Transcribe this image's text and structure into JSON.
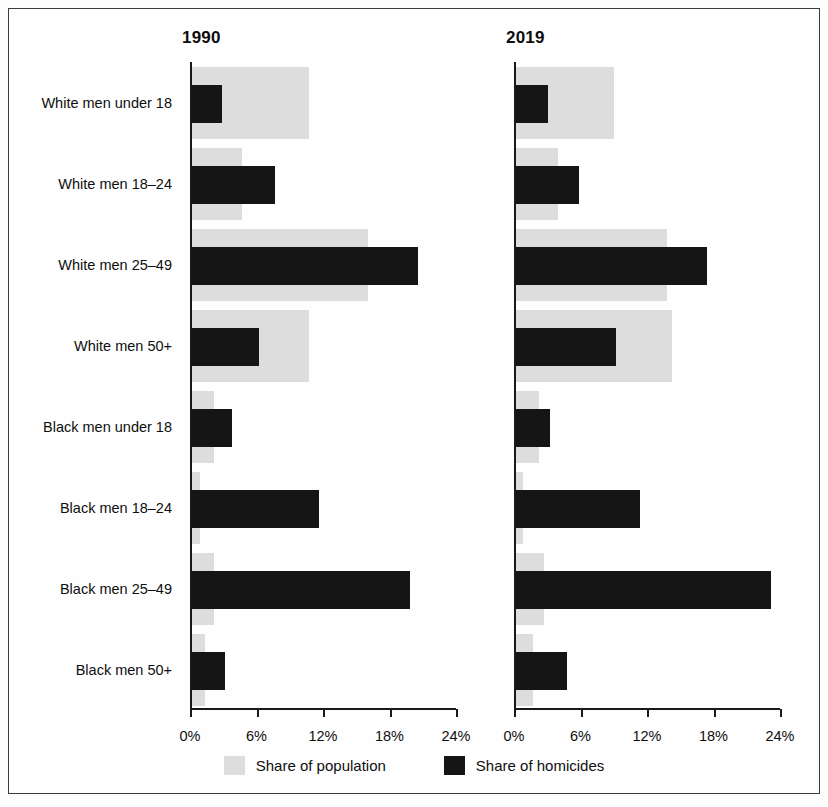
{
  "figure": {
    "panels": [
      {
        "key": "p1990",
        "title": "1990"
      },
      {
        "key": "p2019",
        "title": "2019"
      }
    ],
    "legend": [
      {
        "name": "population",
        "label": "Share of population",
        "color": "#dddddd"
      },
      {
        "name": "homicides",
        "label": "Share of homicides",
        "color": "#151515"
      }
    ]
  },
  "chart_data": {
    "type": "bar",
    "title": "",
    "orientation": "horizontal",
    "panels": [
      "1990",
      "2019"
    ],
    "categories": [
      "White men under 18",
      "White men 18–24",
      "White men 25–49",
      "White men 50+",
      "Black men under 18",
      "Black men 18–24",
      "Black men 25–49",
      "Black men 50+"
    ],
    "series": [
      {
        "name": "Share of population",
        "panel": "1990",
        "color": "#dddddd",
        "values": [
          10.6,
          4.5,
          15.9,
          10.6,
          2.0,
          0.7,
          2.0,
          1.2
        ]
      },
      {
        "name": "Share of homicides",
        "panel": "1990",
        "color": "#151515",
        "values": [
          2.7,
          7.5,
          20.4,
          6.0,
          3.6,
          11.5,
          19.7,
          3.0
        ]
      },
      {
        "name": "Share of population",
        "panel": "2019",
        "color": "#dddddd",
        "values": [
          8.8,
          3.8,
          13.6,
          14.1,
          2.1,
          0.6,
          2.5,
          1.5
        ]
      },
      {
        "name": "Share of homicides",
        "panel": "2019",
        "color": "#151515",
        "values": [
          2.9,
          5.7,
          17.2,
          9.0,
          3.1,
          11.2,
          23.0,
          4.6
        ]
      }
    ],
    "xlabel": "",
    "ylabel": "",
    "xlim": [
      0,
      24
    ],
    "xticks": [
      0,
      6,
      12,
      18,
      24
    ],
    "xtick_labels": [
      "0%",
      "6%",
      "12%",
      "18%",
      "24%"
    ],
    "grid": false,
    "legend_position": "bottom-center"
  }
}
